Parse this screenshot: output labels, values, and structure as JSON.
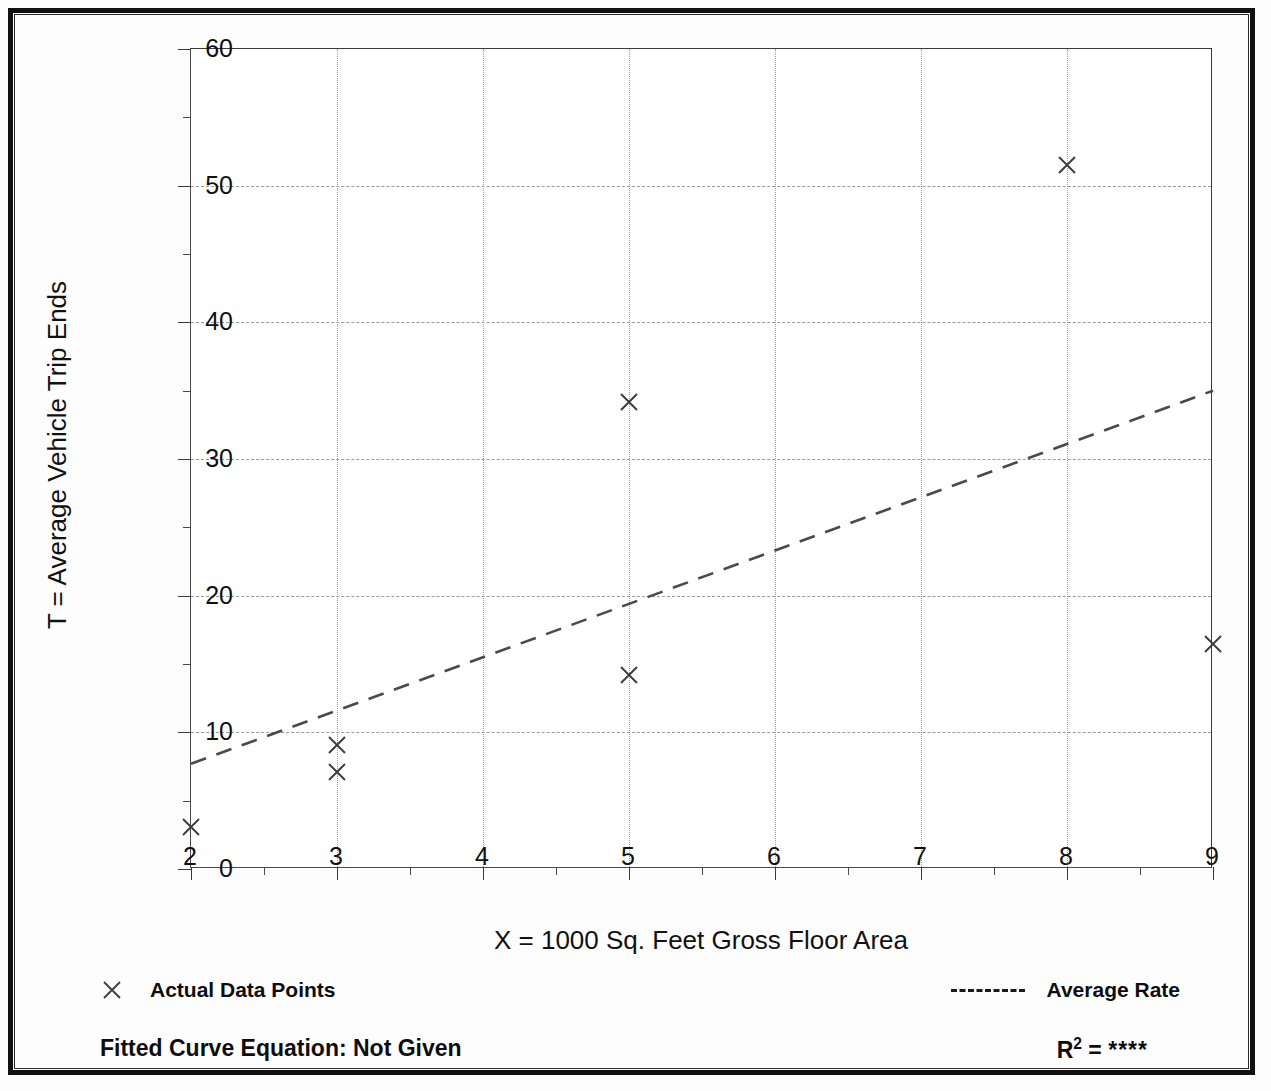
{
  "chart_data": {
    "type": "scatter",
    "title": "",
    "xlabel": "X = 1000 Sq. Feet Gross Floor Area",
    "ylabel": "T = Average Vehicle Trip Ends",
    "xlim": [
      2,
      9
    ],
    "ylim": [
      0,
      60
    ],
    "grid": true,
    "x_ticks": [
      2,
      3,
      4,
      5,
      6,
      7,
      8,
      9
    ],
    "x_tick_labels": [
      "2",
      "3",
      "4",
      "5",
      "6",
      "7",
      "8",
      "9"
    ],
    "x_minor_step": 0.5,
    "y_ticks": [
      0,
      10,
      20,
      30,
      40,
      50,
      60
    ],
    "y_tick_labels": [
      "0",
      "10",
      "20",
      "30",
      "40",
      "50",
      "60"
    ],
    "y_minor_step": 5,
    "series": [
      {
        "name": "Actual Data Points",
        "type": "scatter",
        "marker": "x",
        "points": [
          {
            "x": 2,
            "y": 3.1
          },
          {
            "x": 3,
            "y": 9.1
          },
          {
            "x": 3,
            "y": 7.1
          },
          {
            "x": 5,
            "y": 34.2
          },
          {
            "x": 5,
            "y": 14.2
          },
          {
            "x": 8,
            "y": 51.5
          },
          {
            "x": 9,
            "y": 16.5
          }
        ]
      },
      {
        "name": "Average Rate",
        "type": "line",
        "style": "dashed",
        "points": [
          {
            "x": 2,
            "y": 7.7
          },
          {
            "x": 9,
            "y": 35.0
          }
        ]
      }
    ],
    "legend_position": "below-axes",
    "annotations": {
      "fitted_curve_equation": "Fitted Curve Equation:  Not Given",
      "r_squared_label": "R",
      "r_squared_exponent": "2",
      "r_squared_equals": " = ",
      "r_squared_value": "****"
    }
  },
  "axes": {
    "y_title": "T = Average Vehicle Trip Ends",
    "x_title": "X = 1000 Sq. Feet Gross Floor Area"
  },
  "legend": {
    "data_points_label": "Actual Data Points",
    "average_rate_label": "Average Rate",
    "marker_icon": "x-marker-icon",
    "line_icon": "dashed-line-icon"
  },
  "footer": {
    "fitted_equation": "Fitted Curve Equation:  Not Given",
    "r_label": "R",
    "r_exponent": "2",
    "r_equals": " = ",
    "r_value": "****"
  },
  "colors": {
    "marker": "#3c3c3c",
    "trendline": "#4a4a4a",
    "gridline": "#9a9a9a",
    "axis": "#3a3a3a",
    "text": "#111111",
    "border": "#111111"
  }
}
